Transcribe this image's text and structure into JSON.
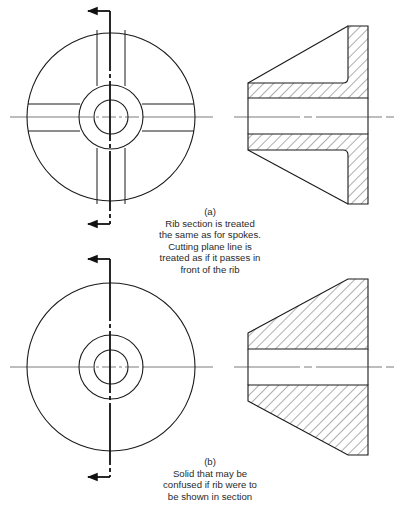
{
  "figure_a": {
    "label": "(a)",
    "caption_lines": [
      "Rib section is treated",
      "the same as for spokes.",
      "Cutting plane line is",
      "treated as if it passes in",
      "front of the rib"
    ]
  },
  "figure_b": {
    "label": "(b)",
    "caption_lines": [
      "Solid that may be",
      "confused if rib were to",
      "be shown in section"
    ]
  },
  "colors": {
    "line": "#1a1a1a",
    "thin_line": "#444444",
    "text": "#2a2a2a",
    "background": "#ffffff"
  }
}
